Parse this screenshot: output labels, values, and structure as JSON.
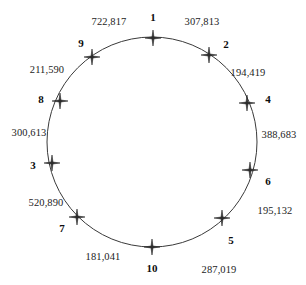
{
  "figure": {
    "kind": "circular-node-diagram",
    "background_color": "#ffffff",
    "circle": {
      "center_x": 152,
      "center_y": 142,
      "radius": 105,
      "stroke_color": "#3a3a3a",
      "stroke_width": 1,
      "fill": "none"
    },
    "marker": {
      "glyph_name": "four-pointed-star",
      "color": "#2b2b2b",
      "size": 11,
      "count": 10
    }
  },
  "chart_data": {
    "type": "scatter",
    "title": "",
    "xlabel": "",
    "ylabel": "",
    "layout": "nodes evenly spaced on a circle, clockwise from top",
    "nodes": [
      {
        "label": "1",
        "angle_deg": 90,
        "x": 153,
        "y": 38,
        "label_x": 153,
        "label_y": 17,
        "value": "307,813",
        "value_x": 202,
        "value_y": 22
      },
      {
        "label": "2",
        "angle_deg": 54,
        "x": 209,
        "y": 55,
        "label_x": 226,
        "label_y": 44,
        "value": "194,419",
        "value_x": 248,
        "value_y": 73
      },
      {
        "label": "4",
        "angle_deg": 18,
        "x": 247,
        "y": 103,
        "label_x": 268,
        "label_y": 99,
        "value": "388,683",
        "value_x": 279,
        "value_y": 135
      },
      {
        "label": "6",
        "angle_deg": -18,
        "x": 250,
        "y": 170,
        "label_x": 268,
        "label_y": 181,
        "value": "195,132",
        "value_x": 275,
        "value_y": 211
      },
      {
        "label": "5",
        "angle_deg": -54,
        "x": 222,
        "y": 218,
        "label_x": 231,
        "label_y": 240,
        "value": "287,019",
        "value_x": 219,
        "value_y": 270
      },
      {
        "label": "10",
        "angle_deg": -90,
        "x": 152,
        "y": 247,
        "label_x": 152,
        "label_y": 268,
        "value": "181,041",
        "value_x": 103,
        "value_y": 257
      },
      {
        "label": "7",
        "angle_deg": 234,
        "x": 77,
        "y": 217,
        "label_x": 62,
        "label_y": 228,
        "value": "520,890",
        "value_x": 46,
        "value_y": 203
      },
      {
        "label": "3",
        "angle_deg": 198,
        "x": 52,
        "y": 163,
        "label_x": 33,
        "label_y": 165,
        "value": "300,613",
        "value_x": 29,
        "value_y": 133
      },
      {
        "label": "8",
        "angle_deg": 162,
        "x": 60,
        "y": 101,
        "label_x": 41,
        "label_y": 99,
        "value": "211,590",
        "value_x": 47,
        "value_y": 70
      },
      {
        "label": "9",
        "angle_deg": 126,
        "x": 92,
        "y": 57,
        "label_x": 81,
        "label_y": 43,
        "value": "722,817",
        "value_x": 109,
        "value_y": 22
      }
    ],
    "node_labels": [
      "1",
      "2",
      "4",
      "6",
      "5",
      "10",
      "7",
      "3",
      "8",
      "9"
    ],
    "values": [
      "307,813",
      "194,419",
      "388,683",
      "195,132",
      "287,019",
      "181,041",
      "520,890",
      "300,613",
      "211,590",
      "722,817"
    ]
  }
}
